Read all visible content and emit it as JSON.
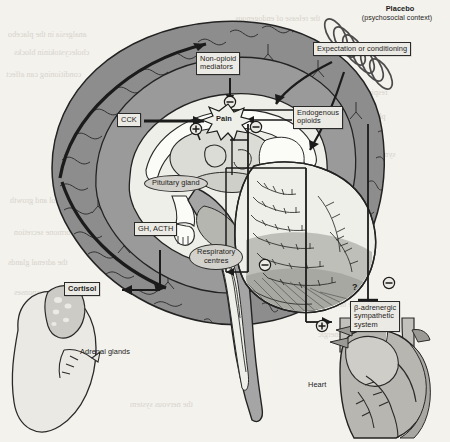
{
  "figure": {
    "domain_note": "grayscale scanned textbook figure: placebo / nocebo mechanisms in the brain",
    "background_color": "#f4f2ed",
    "ink_color": "#1d1d1d",
    "brain_cortex_fill": "#8e8e8e",
    "brain_inner_fill": "#efefe9",
    "brainstem_fill": "#a5a5a5",
    "organ_fill": "#ebe9e4",
    "organ_shade": "#bdbbb5"
  },
  "labels": {
    "placebo_title": "Placebo",
    "placebo_subtitle": "(psychosocial context)",
    "expectation": "Expectation or conditioning",
    "non_opioid": "Non-opioid\nmediators",
    "cck": "CCK",
    "pain": "Pain",
    "endogenous_opioids": "Endogenous\nopioids",
    "pituitary_gland": "Pituitary gland",
    "gh_acth": "GH, ACTH",
    "respiratory_centres": "Respiratory\ncentres",
    "cortisol": "Cortisol",
    "adrenal_glands": "Adrenal glands",
    "beta_adrenergic": "β-adrenergic\nsympathetic\nsystem",
    "heart": "Heart",
    "question_mark": "?"
  },
  "signs": {
    "minus": "−",
    "plus": "+",
    "minus_above_pain": "−",
    "minus_right_of_pain": "−",
    "plus_left_of_pain": "+",
    "minus_respiratory": "−",
    "minus_sympathetic": "−",
    "plus_sympathetic": "+"
  },
  "ghost_text": {
    "lines": [
      "the release of endogenous",
      "analgesia in the placebo",
      "cholecystokinin blocks",
      "conditioning can affect",
      "respiratory centres and",
      "beta-adrenergic tone",
      "sympathetic activity",
      "cortisol and growth",
      "hormone secretion",
      "the adrenal glands",
      "placebo responses",
      "of the heart rate"
    ]
  }
}
